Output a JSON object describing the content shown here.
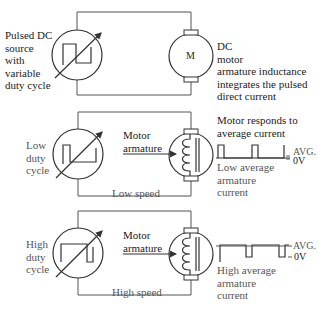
{
  "panels": [
    {
      "id": "overview",
      "source_label": [
        "Pulsed DC",
        "source",
        "with",
        "variable",
        "duty cycle"
      ],
      "motor_symbol": "M",
      "motor_label": [
        "DC",
        "motor",
        "armature inductance",
        "integrates the pulsed",
        "direct current"
      ]
    },
    {
      "id": "low",
      "source_label": [
        "Low",
        "duty",
        "cycle"
      ],
      "armature_label": [
        "Motor",
        "armature"
      ],
      "speed_label": "Low speed",
      "response_label": [
        "Motor responds to",
        "average current"
      ],
      "avg_label": "AVG.",
      "zero_label": "0V",
      "current_label": [
        "Low average",
        "armature",
        "current"
      ]
    },
    {
      "id": "high",
      "source_label": [
        "High",
        "duty",
        "cycle"
      ],
      "armature_label": [
        "Motor",
        "armature"
      ],
      "speed_label": "High speed",
      "avg_label": "AVG.",
      "zero_label": "0V",
      "current_label": [
        "High average",
        "armature",
        "current"
      ]
    }
  ],
  "icons": {
    "pulsed-source": "circle with square wave and variable arrow",
    "dc-motor": "circle with brushes",
    "armature-coil": "inductor coil with core"
  }
}
